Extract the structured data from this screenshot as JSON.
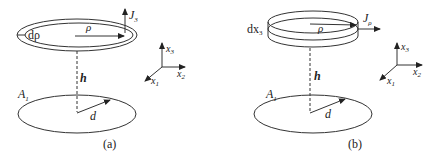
{
  "panels": [
    {
      "id": "a",
      "caption": "(a)",
      "top_element": "ring",
      "labels": {
        "ring_width": "dρ",
        "radius": "ρ",
        "flux": "J",
        "flux_sub": "3",
        "height": "h",
        "area": "A",
        "area_sub": "1",
        "disk_radius": "d"
      }
    },
    {
      "id": "b",
      "caption": "(b)",
      "top_element": "cylindrical-shell",
      "labels": {
        "ring_width": "dx",
        "ring_width_sub": "3",
        "radius": "ρ",
        "flux": "J",
        "flux_sub": "ρ",
        "height": "h",
        "area": "A",
        "area_sub": "1",
        "disk_radius": "d"
      }
    }
  ],
  "axes": {
    "x1": "x",
    "x1_sub": "1",
    "x2": "x",
    "x2_sub": "2",
    "x3": "x",
    "x3_sub": "3"
  },
  "colors": {
    "stroke": "#333333",
    "background": "#ffffff"
  }
}
